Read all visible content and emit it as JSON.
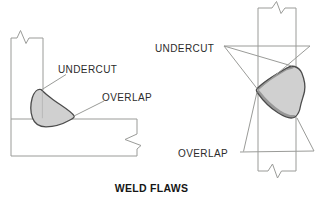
{
  "diagram": {
    "title": "WELD FLAWS",
    "figures": [
      {
        "id": "fillet-weld-on-tee-joint",
        "labels": {
          "undercut": "UNDERCUT",
          "overlap": "OVERLAP"
        }
      },
      {
        "id": "weld-bead-on-vertical-plate",
        "labels": {
          "undercut": "UNDERCUT",
          "overlap": "OVERLAP"
        }
      }
    ],
    "colors": {
      "line": "#9a9b98",
      "weld_fill": "#d0d0d0",
      "weld_outline": "#4c4c4c",
      "weld_band": "#989898",
      "hidden_edge": "#b2b2b2",
      "text": "#2b2b2b",
      "background": "#ffffff"
    }
  }
}
